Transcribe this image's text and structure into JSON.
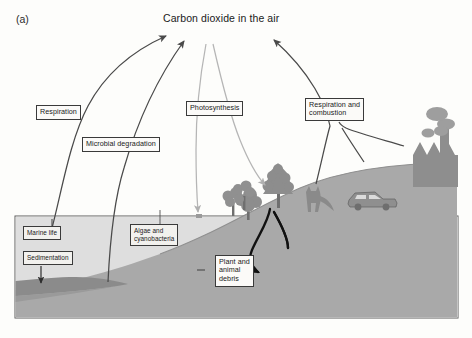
{
  "figure": {
    "panel_letter": "(a)",
    "title": "Carbon dioxide in the air",
    "type": "carbon-cycle-diagram"
  },
  "labels": {
    "respiration": "Respiration",
    "microbial_degradation": "Microbial degradation",
    "photosynthesis": "Photosynthesis",
    "respiration_and_combustion": "Respiration and\ncombustion",
    "marine_life": "Marine life",
    "sedimentation": "Sedimentation",
    "algae_and_cyanobacteria": "Algae and\ncyanobacteria",
    "plant_and_animal_debris": "Plant and\nanimal\ndebris"
  },
  "scene_objects": {
    "factory": "factory",
    "smoke": "smoke-plume",
    "car": "car",
    "fox": "fox",
    "tree_large": "tree",
    "tree_small": "tree",
    "tree_far_left": "tree",
    "ocean": "ocean",
    "seabed": "seabed",
    "sediment_layer": "sediment-layer",
    "hill": "hill"
  },
  "colors": {
    "background": "#fdfdfb",
    "label_fill": "#f2f1ee",
    "outline": "#3a3a3a",
    "water": "#dcdcdc",
    "ground": "#a8a8a8",
    "seabed": "#9d9d9d",
    "sediment": "#8a8a8a",
    "arrow_dark": "#4a4a4a",
    "arrow_light": "#b5b5b5",
    "arrow_black": "#111111",
    "vegetation": "#8f8f8f",
    "smoke": "#9a9a9a"
  },
  "flows": [
    {
      "name": "respiration-to-air",
      "from": "marine life",
      "to": "carbon dioxide in the air",
      "label": "Respiration"
    },
    {
      "name": "microbial-degradation-to-air",
      "from": "sediment / debris",
      "to": "carbon dioxide in the air",
      "label": "Microbial degradation"
    },
    {
      "name": "photosynthesis-to-trees",
      "from": "carbon dioxide in the air",
      "to": "trees",
      "label": "Photosynthesis"
    },
    {
      "name": "photosynthesis-to-algae",
      "from": "carbon dioxide in the air",
      "to": "algae and cyanobacteria",
      "label": "Photosynthesis"
    },
    {
      "name": "respiration-combustion-to-air",
      "from": "fox, car and factory",
      "to": "carbon dioxide in the air",
      "label": "Respiration and combustion"
    },
    {
      "name": "sedimentation-down",
      "from": "marine life",
      "to": "sediment",
      "label": "Sedimentation"
    },
    {
      "name": "trees-and-fox-to-debris",
      "from": "trees and animals",
      "to": "plant and animal debris",
      "label": "Plant and animal debris"
    }
  ]
}
